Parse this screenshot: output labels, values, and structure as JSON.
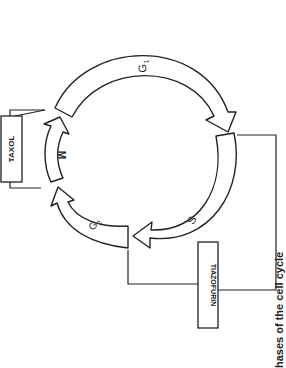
{
  "diagram": {
    "orientation": "rotated 90deg clockwise (scanned page)",
    "phases": [
      {
        "id": "G1",
        "label": "G",
        "sub": "1"
      },
      {
        "id": "S",
        "label": "S",
        "sub": ""
      },
      {
        "id": "G2",
        "label": "G",
        "sub": "2"
      },
      {
        "id": "M",
        "label": "M",
        "sub": ""
      }
    ],
    "drugs": [
      {
        "name": "TAXOL",
        "acts_on": "M"
      },
      {
        "name": "TIAZOFURIN",
        "acts_on": "S"
      }
    ],
    "caption_fragment": "hases of the cell cycle"
  },
  "colors": {
    "ink": "#222222",
    "paper": "#ffffff"
  }
}
